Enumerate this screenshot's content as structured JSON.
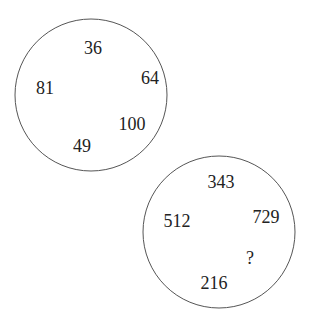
{
  "puzzle": {
    "circles": [
      {
        "name": "squares-circle",
        "numbers": [
          {
            "value": "36",
            "x": 93,
            "y": 54
          },
          {
            "value": "64",
            "x": 150,
            "y": 84
          },
          {
            "value": "81",
            "x": 45,
            "y": 94
          },
          {
            "value": "100",
            "x": 132,
            "y": 130
          },
          {
            "value": "49",
            "x": 82,
            "y": 152
          }
        ]
      },
      {
        "name": "cubes-circle",
        "numbers": [
          {
            "value": "343",
            "x": 221,
            "y": 188
          },
          {
            "value": "512",
            "x": 177,
            "y": 227
          },
          {
            "value": "729",
            "x": 266,
            "y": 223
          },
          {
            "value": "?",
            "x": 250,
            "y": 264
          },
          {
            "value": "216",
            "x": 214,
            "y": 289
          }
        ]
      }
    ],
    "colors": {
      "stroke": "#555555",
      "text": "#222222",
      "background": "#ffffff"
    }
  }
}
